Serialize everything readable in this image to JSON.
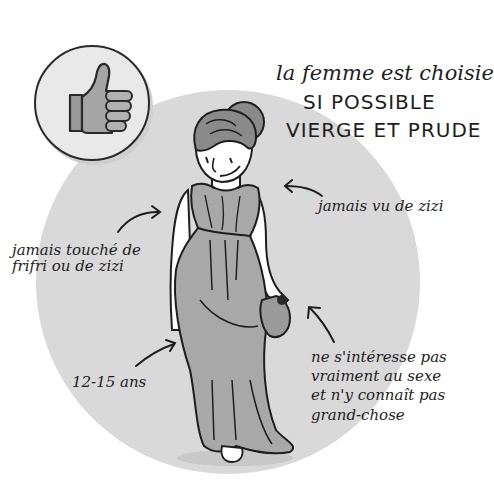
{
  "illustration": {
    "headline": {
      "line1": "la femme est choisie",
      "line2": "SI POSSIBLE",
      "line3": "VIERGE ET PRUDE"
    },
    "badge_icon": "thumbs-up-icon",
    "annotations": {
      "left_top": "jamais touché de\nfrifri ou de zizi",
      "right_top": "jamais vu de zizi",
      "left_bottom": "12-15 ans",
      "right_bottom": "ne s'intéresse pas\nvraiment au sexe\net n'y connaît pas\ngrand-chose"
    },
    "colors": {
      "circle_fill": "#d9d9d9",
      "badge_fill": "#e9e9e9",
      "ink": "#1e1e1e",
      "dress": "#a8a8a8",
      "hair": "#8a8a8a"
    }
  }
}
